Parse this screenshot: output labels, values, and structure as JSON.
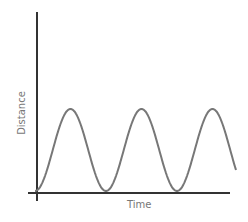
{
  "chart_data": {
    "type": "line",
    "title": "",
    "xlabel": "Time",
    "ylabel": "Distance",
    "grid": false,
    "legend": null,
    "x": [
      0,
      0.5,
      1,
      1.5,
      2,
      2.5,
      3,
      3.5,
      3.83
    ],
    "values": [
      0,
      1,
      0,
      1,
      0,
      1,
      0,
      1,
      0.2
    ],
    "series": [
      {
        "name": "Distance",
        "color": "#777777",
        "peaks_at_x": [
          0.5,
          1.5,
          2.5
        ],
        "troughs_at_x": [
          0,
          1,
          2
        ]
      }
    ],
    "xlim": [
      0,
      3.9
    ],
    "ylim": [
      0,
      1.1
    ]
  },
  "colors": {
    "axis": "#333333",
    "curve": "#777777",
    "label": "#777777"
  },
  "geometry": {
    "origin": [
      37,
      192
    ],
    "y_axis_top": 12,
    "x_axis_end": 230,
    "amplitude_px": 82,
    "period_px": 71,
    "curve_x_start": 35,
    "curve_x_end": 236
  }
}
